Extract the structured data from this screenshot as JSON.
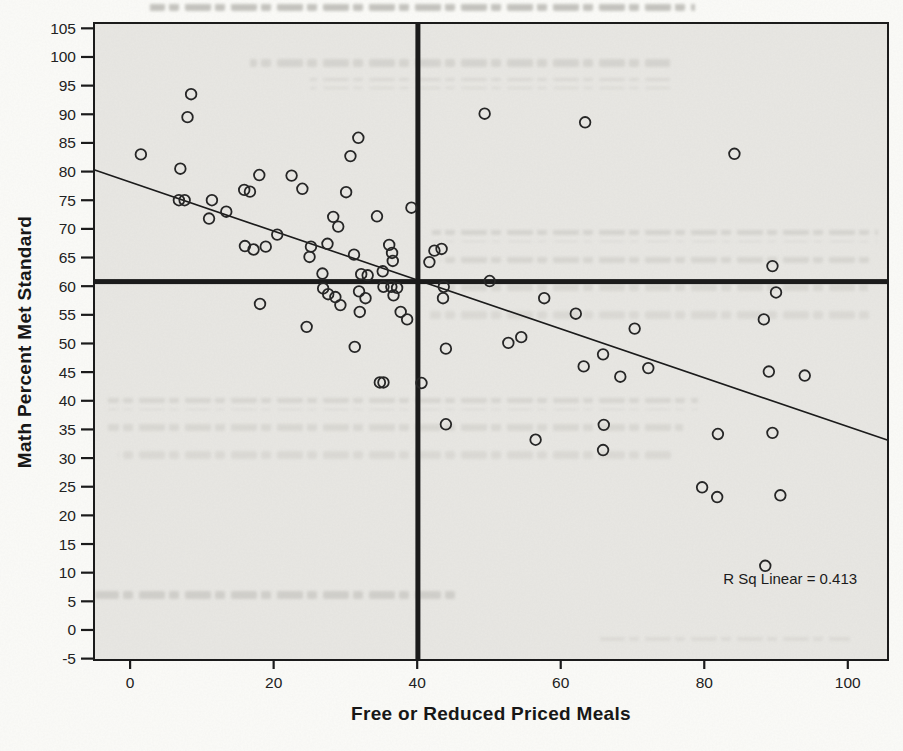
{
  "chart_data": {
    "type": "scatter",
    "title": "",
    "xlabel": "Free or Reduced Priced Meals",
    "ylabel": "Math Percent Met Standard",
    "xlim": [
      -5.03,
      105.6
    ],
    "ylim": [
      -5.24,
      105.93
    ],
    "x_ticks": [
      0,
      20,
      40,
      60,
      80,
      100
    ],
    "y_ticks": [
      -5,
      0,
      5,
      10,
      15,
      20,
      25,
      30,
      35,
      40,
      45,
      50,
      55,
      60,
      65,
      70,
      75,
      80,
      85,
      90,
      95,
      100,
      105
    ],
    "grid": false,
    "legend": "none",
    "points": [
      [
        1.5,
        83
      ],
      [
        7,
        80.5
      ],
      [
        8,
        89.5
      ],
      [
        8.5,
        93.5
      ],
      [
        6.8,
        75
      ],
      [
        7.6,
        75
      ],
      [
        11.4,
        75
      ],
      [
        11,
        71.8
      ],
      [
        13.4,
        73
      ],
      [
        15.9,
        76.8
      ],
      [
        16.7,
        76.5
      ],
      [
        18,
        79.4
      ],
      [
        22.5,
        79.3
      ],
      [
        24,
        77
      ],
      [
        20.5,
        69
      ],
      [
        16,
        67
      ],
      [
        17.2,
        66.4
      ],
      [
        18.9,
        66.9
      ],
      [
        25.2,
        66.9
      ],
      [
        25,
        65.1
      ],
      [
        27.5,
        67.4
      ],
      [
        28.3,
        72.1
      ],
      [
        29,
        70.4
      ],
      [
        30.1,
        76.4
      ],
      [
        30.7,
        82.7
      ],
      [
        31.8,
        85.9
      ],
      [
        31.2,
        65.5
      ],
      [
        34.4,
        72.2
      ],
      [
        39.2,
        73.7
      ],
      [
        36.1,
        67.2
      ],
      [
        36.5,
        65.8
      ],
      [
        36.6,
        64.4
      ],
      [
        26.8,
        62.2
      ],
      [
        32.2,
        62.1
      ],
      [
        33.1,
        61.9
      ],
      [
        35.2,
        62.6
      ],
      [
        18.1,
        56.9
      ],
      [
        24.6,
        52.9
      ],
      [
        26.9,
        59.6
      ],
      [
        27.6,
        58.6
      ],
      [
        28.6,
        58.1
      ],
      [
        29.3,
        56.7
      ],
      [
        31.9,
        59.1
      ],
      [
        32.8,
        57.9
      ],
      [
        32,
        55.5
      ],
      [
        35.3,
        59.9
      ],
      [
        36.4,
        59.9
      ],
      [
        37.2,
        59.7
      ],
      [
        36.7,
        58.4
      ],
      [
        37.7,
        55.5
      ],
      [
        38.6,
        54.2
      ],
      [
        31.3,
        49.4
      ],
      [
        34.8,
        43.2
      ],
      [
        35.3,
        43.2
      ],
      [
        41.7,
        64.2
      ],
      [
        42.4,
        66.2
      ],
      [
        43.4,
        66.5
      ],
      [
        43.7,
        59.9
      ],
      [
        43.6,
        57.9
      ],
      [
        40.6,
        43.1
      ],
      [
        44,
        49.1
      ],
      [
        44,
        35.9
      ],
      [
        49.4,
        90.1
      ],
      [
        50.1,
        60.9
      ],
      [
        52.7,
        50.1
      ],
      [
        54.5,
        51.1
      ],
      [
        56.5,
        33.2
      ],
      [
        57.7,
        57.9
      ],
      [
        62.1,
        55.2
      ],
      [
        63.4,
        88.6
      ],
      [
        63.2,
        46
      ],
      [
        65.9,
        48.1
      ],
      [
        66,
        35.8
      ],
      [
        65.9,
        31.4
      ],
      [
        68.3,
        44.2
      ],
      [
        70.3,
        52.6
      ],
      [
        72.2,
        45.7
      ],
      [
        79.7,
        24.9
      ],
      [
        81.8,
        23.2
      ],
      [
        81.9,
        34.2
      ],
      [
        84.2,
        83.1
      ],
      [
        88.3,
        54.2
      ],
      [
        88.5,
        11.2
      ],
      [
        89,
        45.1
      ],
      [
        89.5,
        63.5
      ],
      [
        89.5,
        34.4
      ],
      [
        90,
        58.9
      ],
      [
        90.6,
        23.5
      ],
      [
        94,
        44.4
      ]
    ],
    "regression_line": {
      "x1": -5.03,
      "y1": 80.3,
      "x2": 105.6,
      "y2": 33.1
    },
    "reference_lines": {
      "vertical_x": 40.1,
      "horizontal_y": 60.8
    },
    "annotation": {
      "label": "R Sq Linear = 0.413",
      "x": 101.3,
      "y": 8.9,
      "anchor": "end"
    },
    "colors": {
      "page_bg": "#fbfbf8",
      "plot_bg": "#e8e7e3",
      "ink": "#1b1b1b",
      "point_stroke": "#262626",
      "tick_label": "#222222"
    }
  }
}
